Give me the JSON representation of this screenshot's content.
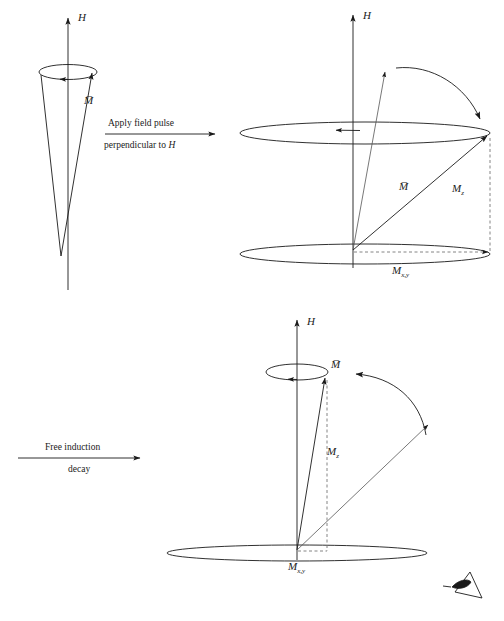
{
  "figure": {
    "panels": [
      {
        "id": "equilibrium",
        "name": "Equilibrium magnetization",
        "axis_label": "H",
        "vector_label": "M̅",
        "description": "Magnetization vector precessing at small angle about the static field H"
      },
      {
        "id": "after-pulse",
        "name": "After perpendicular field pulse",
        "axis_label": "H",
        "vector_label": "M̅",
        "component_z_label": "M",
        "component_z_sub": "z",
        "component_xy_label": "M",
        "component_xy_sub": "x,y",
        "description": "Magnetization tipped into the transverse plane, precessing in the x-y plane"
      },
      {
        "id": "free-induction-decay",
        "name": "Free induction decay",
        "axis_label": "H",
        "vector_label": "M̅",
        "component_z_label": "M",
        "component_z_sub": "z",
        "component_xy_label": "M",
        "component_xy_sub": "x,y",
        "description": "Magnetization relaxing back toward the z-axis"
      }
    ],
    "transitions": [
      {
        "id": "apply-pulse",
        "line1": "Apply field pulse",
        "line2_pre": "perpendicular to ",
        "line2_italic": "H",
        "direction": "right"
      },
      {
        "id": "fid",
        "line1": "Free induction",
        "line2": "decay",
        "line2_italic": "",
        "direction": "right"
      }
    ],
    "observer": {
      "icon_name": "eye-icon",
      "label": ""
    },
    "colors": {
      "ink": "#1a1a1a",
      "thin_ink": "#555555",
      "dashed": "#777777",
      "background": "#ffffff"
    }
  }
}
